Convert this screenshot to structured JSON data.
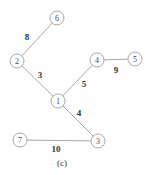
{
  "figure": {
    "caption": "(c)",
    "caption_x": 62,
    "caption_y": 163
  },
  "chart_data": {
    "type": "diagram",
    "subtype": "weighted-graph",
    "title": "(c)",
    "nodes": [
      {
        "id": "1",
        "label": "1",
        "x": 58,
        "y": 101,
        "r": 7
      },
      {
        "id": "2",
        "label": "2",
        "x": 17,
        "y": 61,
        "r": 7
      },
      {
        "id": "3",
        "label": "3",
        "x": 98,
        "y": 141,
        "r": 7
      },
      {
        "id": "4",
        "label": "4",
        "x": 97,
        "y": 60,
        "r": 7
      },
      {
        "id": "5",
        "label": "5",
        "x": 135,
        "y": 59,
        "r": 7
      },
      {
        "id": "6",
        "label": "6",
        "x": 57,
        "y": 18,
        "r": 7
      },
      {
        "id": "7",
        "label": "7",
        "x": 20,
        "y": 140,
        "r": 7
      }
    ],
    "edges": [
      {
        "source": "2",
        "target": "6",
        "weight": 8,
        "label": "8",
        "label_x": 27,
        "label_y": 37
      },
      {
        "source": "2",
        "target": "1",
        "weight": 3,
        "label": "3",
        "label_x": 40,
        "label_y": 75
      },
      {
        "source": "1",
        "target": "4",
        "weight": 5,
        "label": "5",
        "label_x": 84,
        "label_y": 84
      },
      {
        "source": "4",
        "target": "5",
        "weight": 9,
        "label": "9",
        "label_x": 116,
        "label_y": 70
      },
      {
        "source": "1",
        "target": "3",
        "weight": 4,
        "label": "4",
        "label_x": 79,
        "label_y": 113
      },
      {
        "source": "7",
        "target": "3",
        "weight": 10,
        "label": "10",
        "label_x": 56,
        "label_y": 149
      }
    ],
    "node_fill": "#ffffff",
    "node_stroke": "#a8a8a8",
    "edge_stroke": "#a8a8a8",
    "label_color": "#333333",
    "background": "#fefefe"
  }
}
